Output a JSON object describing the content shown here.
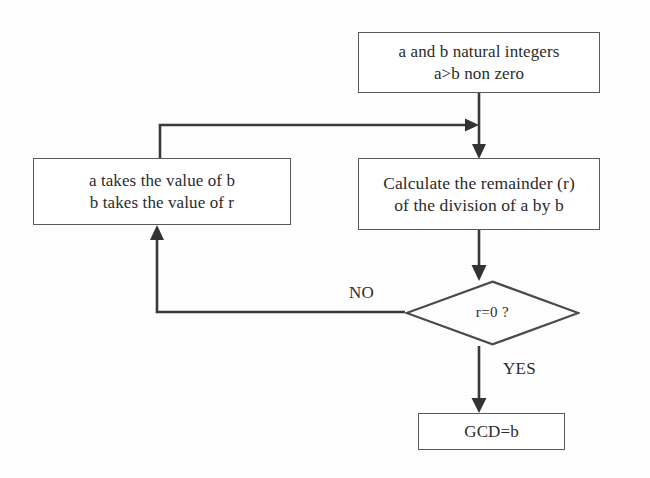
{
  "diagram": {
    "type": "flowchart",
    "stroke_color": "#3a3a3a",
    "text_color": "#2b2b2b",
    "background_color": "#fefefe"
  },
  "nodes": {
    "start": {
      "shape": "rectangle",
      "line1": "a and b natural integers",
      "line2": "a>b non zero"
    },
    "assign": {
      "shape": "rectangle",
      "line1": "a takes the value of b",
      "line2": "b takes the value of r"
    },
    "remainder": {
      "shape": "rectangle",
      "line1": "Calculate the remainder (r)",
      "line2": "of the division of a by b"
    },
    "decision": {
      "shape": "diamond",
      "label": "r=0 ?"
    },
    "result": {
      "shape": "rectangle",
      "label": "GCD=b"
    }
  },
  "edges": {
    "no_label": "NO",
    "yes_label": "YES"
  }
}
